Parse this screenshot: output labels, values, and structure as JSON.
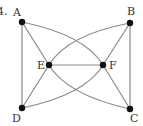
{
  "problem_number": "4.",
  "colors": {
    "edge": "#8a8a8a",
    "node": "#111111",
    "label": "#333333"
  },
  "nodes": [
    {
      "id": "A",
      "label": "A",
      "x": 22,
      "y": 22,
      "lx": 13,
      "ly": 16
    },
    {
      "id": "B",
      "label": "B",
      "x": 130,
      "y": 23,
      "lx": 127,
      "ly": 15
    },
    {
      "id": "E",
      "label": "E",
      "x": 49,
      "y": 65,
      "lx": 37,
      "ly": 69
    },
    {
      "id": "F",
      "label": "F",
      "x": 103,
      "y": 65,
      "lx": 109,
      "ly": 69
    },
    {
      "id": "D",
      "label": "D",
      "x": 22,
      "y": 108,
      "lx": 12,
      "ly": 122
    },
    {
      "id": "C",
      "label": "C",
      "x": 130,
      "y": 109,
      "lx": 130,
      "ly": 122
    }
  ],
  "edges": [
    {
      "from": "A",
      "to": "D",
      "type": "straight"
    },
    {
      "from": "A",
      "to": "E",
      "type": "straight"
    },
    {
      "from": "A",
      "to": "F",
      "type": "curved"
    },
    {
      "from": "B",
      "to": "C",
      "type": "straight"
    },
    {
      "from": "B",
      "to": "F",
      "type": "straight"
    },
    {
      "from": "B",
      "to": "E",
      "type": "curved"
    },
    {
      "from": "E",
      "to": "F",
      "type": "straight"
    },
    {
      "from": "E",
      "to": "D",
      "type": "straight"
    },
    {
      "from": "E",
      "to": "C",
      "type": "curved"
    },
    {
      "from": "F",
      "to": "C",
      "type": "straight"
    },
    {
      "from": "F",
      "to": "D",
      "type": "curved"
    }
  ]
}
